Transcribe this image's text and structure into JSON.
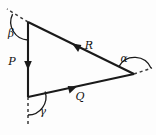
{
  "figure": {
    "background_color": "#fdfdfd",
    "line_color": "#1a1a1a",
    "dashed_color": "#3a3a3a"
  },
  "vectors": [
    {
      "id": "P",
      "label": "P",
      "direction": "down",
      "edge": "left-vertical"
    },
    {
      "id": "Q",
      "label": "Q",
      "direction": "right-down",
      "edge": "bottom"
    },
    {
      "id": "R",
      "label": "R",
      "direction": "up-left",
      "edge": "top"
    }
  ],
  "angles": [
    {
      "id": "beta",
      "label": "β",
      "vertex": "top-left"
    },
    {
      "id": "alpha",
      "label": "α",
      "vertex": "right"
    },
    {
      "id": "gamma",
      "label": "γ",
      "vertex": "bottom-left"
    }
  ],
  "labels": {
    "P": "P",
    "Q": "Q",
    "R": "R",
    "alpha": "α",
    "beta": "β",
    "gamma": "γ"
  },
  "geometry": {
    "vertex_top": [
      28,
      22
    ],
    "vertex_bottom": [
      28,
      97
    ],
    "vertex_right": [
      134,
      74
    ]
  }
}
